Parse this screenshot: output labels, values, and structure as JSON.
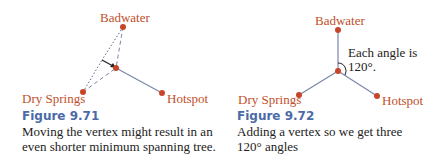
{
  "figures": [
    {
      "number": "Figure 9.71",
      "caption_line1": "Moving the vertex might result in an",
      "caption_line2": "even shorter minimum spanning tree.",
      "nodes": {
        "badwater": "Badwater",
        "dry_springs": "Dry Springs",
        "hotspot": "Hotspot"
      }
    },
    {
      "number": "Figure 9.72",
      "caption_line1": "Adding a vertex so we get three",
      "caption_line2": "120° angles",
      "annotation_line1": "Each angle is",
      "annotation_line2": "120°.",
      "nodes": {
        "badwater": "Badwater",
        "dry_springs": "Dry Springs",
        "hotspot": "Hotspot"
      }
    }
  ],
  "colors": {
    "node": "#c8452a",
    "label": "#c0502a",
    "edge": "#7a86a8",
    "figure_title": "#4a6aa8"
  }
}
